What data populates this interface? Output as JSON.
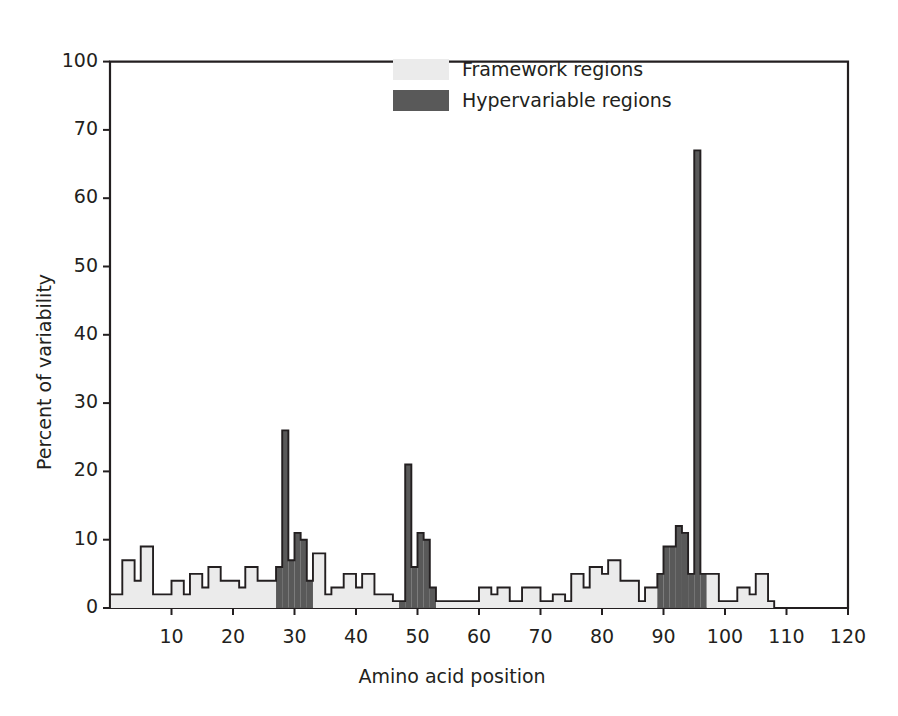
{
  "chart_data": {
    "type": "bar",
    "title": "",
    "xlabel": "Amino acid position",
    "ylabel": "Percent of variability",
    "xlim": [
      0,
      120
    ],
    "ylim": [
      0,
      100
    ],
    "xticks": [
      10,
      20,
      30,
      40,
      50,
      60,
      70,
      80,
      90,
      100,
      110,
      120
    ],
    "yticks": [
      0,
      10,
      20,
      30,
      40,
      50,
      60,
      70,
      100
    ],
    "y_axis_note": "broken axis: 70 to 100 compressed to one 10-unit step",
    "grid": "off",
    "legend_position": "top-center",
    "series": [
      {
        "name": "Framework regions",
        "color": "#ebebeb",
        "edge": "#231f20"
      },
      {
        "name": "Hypervariable regions",
        "color": "#595959",
        "edge": "#231f20"
      }
    ],
    "hypervariable_ranges": [
      [
        28,
        33
      ],
      [
        48,
        53
      ],
      [
        90,
        97
      ]
    ],
    "categories": [
      1,
      2,
      3,
      4,
      5,
      6,
      7,
      8,
      9,
      10,
      11,
      12,
      13,
      14,
      15,
      16,
      17,
      18,
      19,
      20,
      21,
      22,
      23,
      24,
      25,
      26,
      27,
      28,
      29,
      30,
      31,
      32,
      33,
      34,
      35,
      36,
      37,
      38,
      39,
      40,
      41,
      42,
      43,
      44,
      45,
      46,
      47,
      48,
      49,
      50,
      51,
      52,
      53,
      54,
      55,
      56,
      57,
      58,
      59,
      60,
      61,
      62,
      63,
      64,
      65,
      66,
      67,
      68,
      69,
      70,
      71,
      72,
      73,
      74,
      75,
      76,
      77,
      78,
      79,
      80,
      81,
      82,
      83,
      84,
      85,
      86,
      87,
      88,
      89,
      90,
      91,
      92,
      93,
      94,
      95,
      96,
      97,
      98,
      99,
      100,
      101,
      102,
      103,
      104,
      105,
      106,
      107,
      108,
      109,
      110,
      111,
      112,
      113,
      114,
      115,
      116,
      117,
      118,
      119,
      120
    ],
    "values": [
      2,
      2,
      7,
      7,
      4,
      9,
      9,
      2,
      2,
      2,
      4,
      4,
      2,
      5,
      5,
      3,
      6,
      6,
      4,
      4,
      4,
      3,
      6,
      6,
      4,
      4,
      4,
      6,
      26,
      7,
      11,
      10,
      4,
      8,
      8,
      2,
      3,
      3,
      5,
      5,
      3,
      5,
      5,
      2,
      2,
      2,
      1,
      1,
      21,
      6,
      11,
      10,
      3,
      1,
      1,
      1,
      1,
      1,
      1,
      1,
      3,
      3,
      2,
      3,
      3,
      1,
      1,
      3,
      3,
      3,
      1,
      1,
      2,
      2,
      1,
      5,
      5,
      3,
      6,
      6,
      5,
      7,
      7,
      4,
      4,
      4,
      1,
      3,
      3,
      5,
      9,
      9,
      12,
      11,
      5,
      67,
      5,
      5,
      5,
      1,
      1,
      1,
      3,
      3,
      2,
      5,
      5,
      1,
      0,
      0,
      0,
      0,
      0,
      0,
      0,
      0,
      0,
      0,
      0,
      0
    ]
  },
  "legend": {
    "items": [
      {
        "label": "Framework regions",
        "swatch": "#ebebeb"
      },
      {
        "label": "Hypervariable regions",
        "swatch": "#595959"
      }
    ]
  },
  "colors": {
    "framework_fill": "#ebebeb",
    "hypervariable_fill": "#595959",
    "axis": "#231f20",
    "outline": "#231f20",
    "background": "#ffffff"
  }
}
